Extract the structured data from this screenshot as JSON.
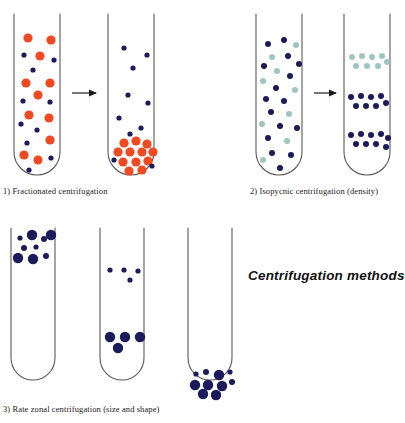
{
  "title": "Centrifugation methods",
  "colors": {
    "tube_stroke": "#59595b",
    "particle_orange": "#f04a23",
    "particle_navy": "#1b1b5c",
    "particle_teal": "#9fc5c3",
    "arrow": "#1a1a1a",
    "background": "#ffffff",
    "text": "#1a1a1a"
  },
  "captions": {
    "panel1": "1) Fractionated centrifugation",
    "panel2": "2) Isopycnic centrifugation (density)",
    "panel3": "3) Rate zonal centrifugation (size and shape)"
  },
  "diagram_data": {
    "type": "diagram",
    "subject": "Centrifugation separation methods",
    "panels": [
      {
        "id": "panel1",
        "label": "1) Fractionated centrifugation",
        "principle": "separation by sedimentation rate; heavy orange particles pellet at tube bottom",
        "tubes": [
          {
            "state": "before",
            "description": "orange and navy particles distributed evenly throughout tube"
          },
          {
            "state": "after",
            "description": "orange particles pelleted at bottom, navy particles remain suspended"
          }
        ],
        "arrow": true
      },
      {
        "id": "panel2",
        "label": "2) Isopycnic centrifugation (density)",
        "principle": "separation by buoyant density; particles band at their isopycnic position",
        "tubes": [
          {
            "state": "before",
            "description": "navy and teal particles mixed uniformly"
          },
          {
            "state": "after",
            "description": "three discrete bands: teal band upper, navy band middle, navy band lower"
          }
        ],
        "arrow": true
      },
      {
        "id": "panel3",
        "label": "3) Rate zonal centrifugation (size and shape)",
        "principle": "separation by size and shape; larger particles migrate faster down the gradient",
        "tubes": [
          {
            "state": "t0",
            "description": "mixed large and small navy particles layered at top of tube"
          },
          {
            "state": "t1",
            "description": "large particles moved to middle zone, small particles lag near top"
          },
          {
            "state": "t2",
            "description": "all particles collected at rounded tube bottom"
          }
        ],
        "arrow": false
      }
    ],
    "particle_types": [
      {
        "name": "orange-large",
        "color": "#f04a23",
        "radius": 4.6
      },
      {
        "name": "navy-small",
        "color": "#1b1b5c",
        "radius": 2.6
      },
      {
        "name": "teal-medium",
        "color": "#9fc5c3",
        "radius": 3.0
      },
      {
        "name": "navy-large",
        "color": "#1b1b5c",
        "radius": 5.2
      }
    ]
  }
}
